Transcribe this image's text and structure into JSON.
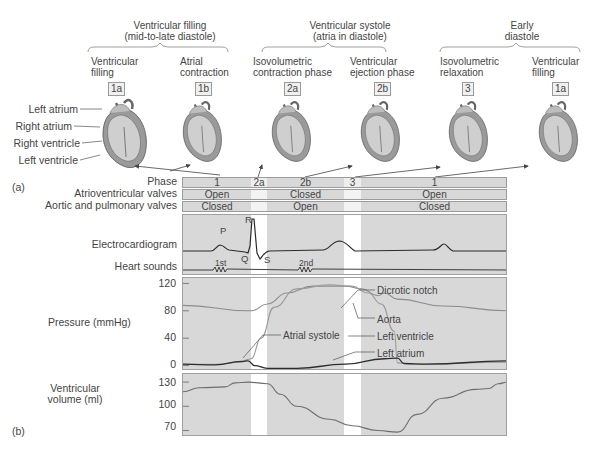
{
  "groups": [
    {
      "title_line1": "Ventricular filling",
      "title_line2": "(mid-to-late diastole)"
    },
    {
      "title_line1": "Ventricular systole",
      "title_line2": "(atria in diastole)"
    },
    {
      "title_line1": "Early",
      "title_line2": "diastole"
    }
  ],
  "phases_top": [
    {
      "name_line1": "Ventricular",
      "name_line2": "filling",
      "code": "1a"
    },
    {
      "name_line1": "Atrial",
      "name_line2": "contraction",
      "code": "1b"
    },
    {
      "name_line1": "Isovolumetric",
      "name_line2": "contraction phase",
      "code": "2a"
    },
    {
      "name_line1": "Ventricular",
      "name_line2": "ejection phase",
      "code": "2b"
    },
    {
      "name_line1": "Isovolumetric",
      "name_line2": "relaxation",
      "code": "3"
    },
    {
      "name_line1": "Ventricular",
      "name_line2": "filling",
      "code": "1a"
    }
  ],
  "heart_labels": [
    "Left atrium",
    "Right atrium",
    "Right ventricle",
    "Left ventricle"
  ],
  "part_labels": {
    "a": "(a)",
    "b": "(b)"
  },
  "rows": {
    "phase": {
      "label": "Phase",
      "cells": [
        "1",
        "2a",
        "2b",
        "3",
        "1"
      ]
    },
    "av_valves": {
      "label": "Atrioventricular valves",
      "cells": [
        "Open",
        "Closed",
        "Open"
      ]
    },
    "semilunar_valves": {
      "label": "Aortic and pulmonary valves",
      "cells": [
        "Closed",
        "Open",
        "Closed"
      ]
    }
  },
  "ecg": {
    "label": "Electrocardiogram",
    "waves": {
      "p": "P",
      "q": "Q",
      "r": "R",
      "s": "S"
    }
  },
  "heart_sounds": {
    "label": "Heart sounds",
    "first": "1st",
    "second": "2nd"
  },
  "colors": {
    "panel_bg": "#d8d8d8",
    "band_white": "#ffffff",
    "ecg_line": "#2b2b2b",
    "aorta_line": "#8c8c8c",
    "ventricle_line": "#9a9a9a",
    "atrium_line": "#2e2e2e",
    "volume_line": "#6e6e6e"
  },
  "chart_data": [
    {
      "type": "line",
      "title": "Pressure (mmHg)",
      "ylabel": "Pressure (mmHg)",
      "yticks": [
        "120",
        "80",
        "40",
        "0"
      ],
      "ylim": [
        -5,
        125
      ],
      "x_unit": "fraction of cardiac cycle shown",
      "annotations": [
        "Dicrotic notch",
        "Aorta",
        "Left ventricle",
        "Left atrium",
        "Atrial systole"
      ],
      "series": [
        {
          "name": "Aorta",
          "x": [
            0,
            0.2,
            0.21,
            0.26,
            0.32,
            0.4,
            0.5,
            0.55,
            0.6,
            0.62,
            0.66,
            0.8,
            1.0
          ],
          "y": [
            88,
            80,
            80,
            90,
            106,
            116,
            116,
            112,
            102,
            106,
            97,
            87,
            80
          ]
        },
        {
          "name": "Left ventricle",
          "x": [
            0,
            0.1,
            0.18,
            0.2,
            0.21,
            0.24,
            0.28,
            0.35,
            0.45,
            0.52,
            0.57,
            0.61,
            0.65,
            0.66,
            0.7,
            1.0
          ],
          "y": [
            2,
            2,
            5,
            9,
            10,
            40,
            85,
            112,
            118,
            116,
            106,
            90,
            50,
            4,
            2,
            5
          ]
        },
        {
          "name": "Left atrium",
          "x": [
            0,
            0.1,
            0.18,
            0.2,
            0.22,
            0.26,
            0.35,
            0.5,
            0.62,
            0.66,
            0.68,
            0.75,
            1.0
          ],
          "y": [
            2,
            1,
            6,
            7,
            0,
            -4,
            -4,
            2,
            10,
            11,
            3,
            2,
            7
          ]
        }
      ]
    },
    {
      "type": "line",
      "title": "Ventricular volume (ml)",
      "ylabel": "Ventricular volume (ml)",
      "yticks": [
        "130",
        "100",
        "70"
      ],
      "ylim": [
        62,
        140
      ],
      "series": [
        {
          "name": "Ventricular volume",
          "x": [
            0,
            0.05,
            0.13,
            0.16,
            0.2,
            0.26,
            0.3,
            0.35,
            0.45,
            0.52,
            0.6,
            0.66,
            0.72,
            0.8,
            0.9,
            0.94,
            0.97,
            1.0
          ],
          "y": [
            118,
            123,
            124,
            129,
            130,
            128,
            115,
            100,
            84,
            76,
            70,
            68,
            90,
            110,
            121,
            122,
            128,
            130
          ]
        }
      ]
    }
  ]
}
